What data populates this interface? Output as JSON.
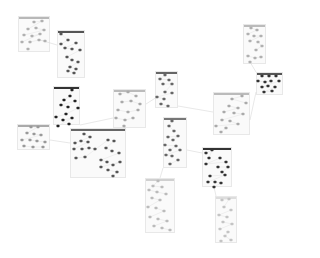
{
  "diagram": {
    "type": "clustered-network-graph",
    "background": "#ffffff",
    "clusters": [
      {
        "id": "A",
        "x": 18,
        "y": 16,
        "w": 32,
        "h": 36,
        "bar": "#b8b8b8",
        "node": "#b0b0b0",
        "nodes": [
          [
            34,
            22
          ],
          [
            42,
            21
          ],
          [
            28,
            29
          ],
          [
            36,
            28
          ],
          [
            44,
            30
          ],
          [
            24,
            35
          ],
          [
            32,
            36
          ],
          [
            40,
            34
          ],
          [
            22,
            42
          ],
          [
            30,
            42
          ],
          [
            39,
            40
          ],
          [
            45,
            41
          ],
          [
            28,
            49
          ]
        ]
      },
      {
        "id": "B",
        "x": 57,
        "y": 30,
        "w": 28,
        "h": 48,
        "bar": "#555555",
        "node": "#555555",
        "nodes": [
          [
            61,
            34
          ],
          [
            68,
            40
          ],
          [
            61,
            44
          ],
          [
            76,
            43
          ],
          [
            65,
            48
          ],
          [
            72,
            49
          ],
          [
            80,
            50
          ],
          [
            67,
            57
          ],
          [
            72,
            60
          ],
          [
            78,
            62
          ],
          [
            70,
            67
          ],
          [
            76,
            69
          ],
          [
            68,
            71
          ],
          [
            74,
            73
          ]
        ]
      },
      {
        "id": "C",
        "x": 53,
        "y": 86,
        "w": 27,
        "h": 39,
        "bar": "#333333",
        "node": "#222222",
        "nodes": [
          [
            72,
            90
          ],
          [
            70,
            96
          ],
          [
            64,
            100
          ],
          [
            75,
            101
          ],
          [
            61,
            105
          ],
          [
            68,
            107
          ],
          [
            78,
            108
          ],
          [
            66,
            114
          ],
          [
            56,
            117
          ],
          [
            63,
            120
          ],
          [
            72,
            118
          ],
          [
            58,
            126
          ],
          [
            69,
            124
          ]
        ]
      },
      {
        "id": "D",
        "x": 113,
        "y": 89,
        "w": 33,
        "h": 39,
        "bar": "#bbbbbb",
        "node": "#aaaaaa",
        "nodes": [
          [
            120,
            94
          ],
          [
            128,
            92
          ],
          [
            136,
            96
          ],
          [
            122,
            102
          ],
          [
            131,
            101
          ],
          [
            140,
            104
          ],
          [
            118,
            110
          ],
          [
            128,
            112
          ],
          [
            138,
            110
          ],
          [
            116,
            118
          ],
          [
            125,
            120
          ],
          [
            133,
            118
          ],
          [
            124,
            126
          ]
        ]
      },
      {
        "id": "E",
        "x": 17,
        "y": 124,
        "w": 33,
        "h": 26,
        "bar": "#aaaaaa",
        "node": "#999999",
        "nodes": [
          [
            31,
            127
          ],
          [
            38,
            127
          ],
          [
            27,
            133
          ],
          [
            34,
            134
          ],
          [
            41,
            135
          ],
          [
            22,
            140
          ],
          [
            30,
            140
          ],
          [
            37,
            141
          ],
          [
            45,
            142
          ],
          [
            24,
            146
          ],
          [
            33,
            147
          ],
          [
            43,
            147
          ]
        ]
      },
      {
        "id": "F",
        "x": 70,
        "y": 128,
        "w": 56,
        "h": 50,
        "bar": "#666666",
        "node": "#555555",
        "nodes": [
          [
            84,
            134
          ],
          [
            90,
            137
          ],
          [
            75,
            143
          ],
          [
            81,
            141
          ],
          [
            88,
            142
          ],
          [
            74,
            149
          ],
          [
            82,
            149
          ],
          [
            89,
            148
          ],
          [
            95,
            149
          ],
          [
            76,
            158
          ],
          [
            85,
            157
          ],
          [
            108,
            140
          ],
          [
            114,
            141
          ],
          [
            106,
            148
          ],
          [
            112,
            151
          ],
          [
            119,
            153
          ],
          [
            101,
            160
          ],
          [
            107,
            162
          ],
          [
            113,
            165
          ],
          [
            120,
            162
          ],
          [
            101,
            167
          ],
          [
            108,
            170
          ],
          [
            117,
            172
          ],
          [
            113,
            176
          ]
        ]
      },
      {
        "id": "G",
        "x": 155,
        "y": 71,
        "w": 23,
        "h": 37,
        "bar": "#666666",
        "node": "#666666",
        "nodes": [
          [
            165,
            75
          ],
          [
            160,
            79
          ],
          [
            169,
            80
          ],
          [
            163,
            84
          ],
          [
            172,
            84
          ],
          [
            165,
            92
          ],
          [
            172,
            93
          ],
          [
            157,
            97
          ],
          [
            164,
            99
          ],
          [
            161,
            104
          ],
          [
            168,
            106
          ]
        ]
      },
      {
        "id": "H",
        "x": 163,
        "y": 117,
        "w": 24,
        "h": 51,
        "bar": "#777777",
        "node": "#666666",
        "nodes": [
          [
            172,
            121
          ],
          [
            169,
            126
          ],
          [
            174,
            131
          ],
          [
            168,
            137
          ],
          [
            178,
            136
          ],
          [
            173,
            140
          ],
          [
            165,
            145
          ],
          [
            176,
            146
          ],
          [
            170,
            150
          ],
          [
            180,
            150
          ],
          [
            166,
            155
          ],
          [
            172,
            156
          ],
          [
            178,
            160
          ],
          [
            170,
            164
          ]
        ]
      },
      {
        "id": "I",
        "x": 213,
        "y": 92,
        "w": 37,
        "h": 43,
        "bar": "#bbbbbb",
        "node": "#aaaaaa",
        "nodes": [
          [
            242,
            96
          ],
          [
            232,
            99
          ],
          [
            246,
            103
          ],
          [
            229,
            106
          ],
          [
            238,
            108
          ],
          [
            224,
            112
          ],
          [
            234,
            113
          ],
          [
            243,
            114
          ],
          [
            222,
            120
          ],
          [
            230,
            121
          ],
          [
            238,
            124
          ],
          [
            216,
            126
          ],
          [
            226,
            128
          ],
          [
            221,
            132
          ]
        ]
      },
      {
        "id": "J",
        "x": 243,
        "y": 24,
        "w": 23,
        "h": 40,
        "bar": "#bbbbbb",
        "node": "#b0b0b0",
        "nodes": [
          [
            251,
            28
          ],
          [
            257,
            30
          ],
          [
            248,
            34
          ],
          [
            254,
            36
          ],
          [
            261,
            36
          ],
          [
            250,
            41
          ],
          [
            258,
            42
          ],
          [
            262,
            46
          ],
          [
            256,
            50
          ],
          [
            248,
            56
          ],
          [
            255,
            58
          ],
          [
            261,
            57
          ],
          [
            250,
            62
          ]
        ]
      },
      {
        "id": "K",
        "x": 256,
        "y": 72,
        "w": 27,
        "h": 23,
        "bar": "#555555",
        "node": "#333333",
        "nodes": [
          [
            262,
            76
          ],
          [
            269,
            76
          ],
          [
            276,
            76
          ],
          [
            258,
            81
          ],
          [
            265,
            82
          ],
          [
            271,
            81
          ],
          [
            279,
            81
          ],
          [
            262,
            87
          ],
          [
            268,
            86
          ],
          [
            275,
            87
          ],
          [
            264,
            92
          ],
          [
            272,
            91
          ]
        ]
      },
      {
        "id": "L",
        "x": 202,
        "y": 147,
        "w": 30,
        "h": 40,
        "bar": "#333333",
        "node": "#333333",
        "nodes": [
          [
            206,
            153
          ],
          [
            212,
            150
          ],
          [
            209,
            158
          ],
          [
            220,
            158
          ],
          [
            206,
            164
          ],
          [
            226,
            162
          ],
          [
            218,
            167
          ],
          [
            228,
            167
          ],
          [
            222,
            172
          ],
          [
            210,
            176
          ],
          [
            225,
            175
          ],
          [
            208,
            182
          ],
          [
            215,
            182
          ],
          [
            221,
            183
          ],
          [
            214,
            187
          ]
        ]
      },
      {
        "id": "M",
        "x": 145,
        "y": 178,
        "w": 30,
        "h": 55,
        "bar": "#d0d0d0",
        "node": "#bbbbbb",
        "nodes": [
          [
            158,
            181
          ],
          [
            153,
            186
          ],
          [
            162,
            187
          ],
          [
            149,
            190
          ],
          [
            157,
            192
          ],
          [
            166,
            194
          ],
          [
            152,
            198
          ],
          [
            160,
            200
          ],
          [
            148,
            207
          ],
          [
            156,
            208
          ],
          [
            164,
            211
          ],
          [
            150,
            217
          ],
          [
            158,
            219
          ],
          [
            167,
            221
          ],
          [
            154,
            226
          ],
          [
            162,
            228
          ],
          [
            170,
            230
          ]
        ]
      },
      {
        "id": "N",
        "x": 215,
        "y": 196,
        "w": 22,
        "h": 47,
        "bar": "#dddddd",
        "node": "#c4c4c4",
        "nodes": [
          [
            222,
            200
          ],
          [
            229,
            199
          ],
          [
            224,
            207
          ],
          [
            231,
            210
          ],
          [
            219,
            215
          ],
          [
            227,
            217
          ],
          [
            223,
            222
          ],
          [
            232,
            224
          ],
          [
            220,
            229
          ],
          [
            228,
            232
          ],
          [
            225,
            236
          ],
          [
            231,
            240
          ],
          [
            221,
            241
          ]
        ]
      }
    ],
    "edges": [
      [
        [
          40,
          40
        ],
        [
          57,
          45
        ]
      ],
      [
        [
          80,
          125
        ],
        [
          113,
          118
        ]
      ],
      [
        [
          146,
          104
        ],
        [
          157,
          97
        ]
      ],
      [
        [
          124,
          126
        ],
        [
          126,
          130
        ]
      ],
      [
        [
          187,
          150
        ],
        [
          202,
          153
        ]
      ],
      [
        [
          214,
          187
        ],
        [
          216,
          196
        ]
      ],
      [
        [
          163,
          168
        ],
        [
          160,
          178
        ]
      ],
      [
        [
          250,
          62
        ],
        [
          256,
          72
        ]
      ],
      [
        [
          250,
          120
        ],
        [
          256,
          92
        ]
      ],
      [
        [
          50,
          140
        ],
        [
          70,
          143
        ]
      ],
      [
        [
          178,
          106
        ],
        [
          213,
          112
        ]
      ]
    ],
    "edge_color": "#d8d8d8"
  }
}
